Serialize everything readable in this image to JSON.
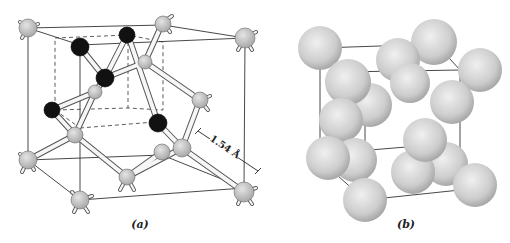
{
  "figure": {
    "panel_a": {
      "caption": "(a)",
      "description": "Ball-and-stick model of diamond cubic lattice",
      "dimension_label": "1.54 Å",
      "colors": {
        "light_atom": "#c8c8c8",
        "dark_atom": "#111111",
        "bond": "#f4f4f4",
        "edge": "#333333"
      }
    },
    "panel_b": {
      "caption": "(b)",
      "description": "Space-filling sphere model of the same unit cell",
      "colors": {
        "sphere": "#cfcfcf",
        "edge": "#333333"
      }
    }
  }
}
